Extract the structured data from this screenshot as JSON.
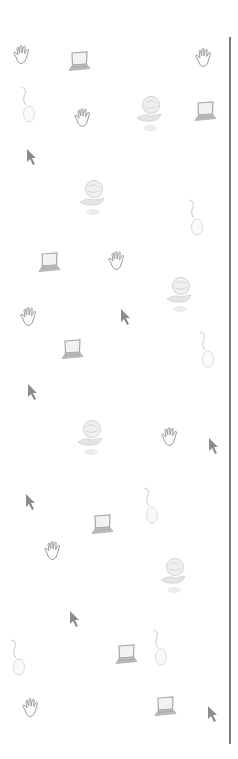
{
  "background": {
    "color": "#ffffff",
    "pattern": "computer-clipart-wallpaper"
  },
  "divider": {
    "color": "#7a7a7a",
    "x": 229,
    "top": 37,
    "bottom": 744
  },
  "colors": {
    "hand": "#9a9a9a",
    "laptop": "#a8a8a8",
    "laptop_screen": "#f2f2f2",
    "mouse": "#d8d8d8",
    "globe": "#d4d4d4",
    "cursor": "#8c8c8c"
  },
  "icons": [
    {
      "type": "hand-icon",
      "x": 11,
      "y": 44
    },
    {
      "type": "laptop-icon",
      "x": 66,
      "y": 50
    },
    {
      "type": "hand-icon",
      "x": 193,
      "y": 47
    },
    {
      "type": "mouse-icon",
      "x": 18,
      "y": 85
    },
    {
      "type": "hand-icon",
      "x": 72,
      "y": 107
    },
    {
      "type": "globe-icon",
      "x": 133,
      "y": 94
    },
    {
      "type": "laptop-icon",
      "x": 192,
      "y": 100
    },
    {
      "type": "cursor-icon",
      "x": 25,
      "y": 148
    },
    {
      "type": "globe-icon",
      "x": 76,
      "y": 178
    },
    {
      "type": "mouse-icon",
      "x": 186,
      "y": 198
    },
    {
      "type": "laptop-icon",
      "x": 36,
      "y": 251
    },
    {
      "type": "hand-icon",
      "x": 106,
      "y": 250
    },
    {
      "type": "globe-icon",
      "x": 163,
      "y": 275
    },
    {
      "type": "cursor-icon",
      "x": 119,
      "y": 308
    },
    {
      "type": "hand-icon",
      "x": 18,
      "y": 306
    },
    {
      "type": "laptop-icon",
      "x": 59,
      "y": 338
    },
    {
      "type": "mouse-icon",
      "x": 197,
      "y": 330
    },
    {
      "type": "cursor-icon",
      "x": 26,
      "y": 383
    },
    {
      "type": "globe-icon",
      "x": 74,
      "y": 418
    },
    {
      "type": "hand-icon",
      "x": 159,
      "y": 426
    },
    {
      "type": "cursor-icon",
      "x": 207,
      "y": 437
    },
    {
      "type": "mouse-icon",
      "x": 141,
      "y": 486
    },
    {
      "type": "cursor-icon",
      "x": 24,
      "y": 493
    },
    {
      "type": "laptop-icon",
      "x": 89,
      "y": 513
    },
    {
      "type": "hand-icon",
      "x": 42,
      "y": 540
    },
    {
      "type": "globe-icon",
      "x": 157,
      "y": 556
    },
    {
      "type": "cursor-icon",
      "x": 68,
      "y": 610
    },
    {
      "type": "mouse-icon",
      "x": 150,
      "y": 628
    },
    {
      "type": "mouse-icon",
      "x": 8,
      "y": 638
    },
    {
      "type": "laptop-icon",
      "x": 113,
      "y": 643
    },
    {
      "type": "hand-icon",
      "x": 20,
      "y": 697
    },
    {
      "type": "laptop-icon",
      "x": 152,
      "y": 695
    },
    {
      "type": "cursor-icon",
      "x": 206,
      "y": 705
    }
  ]
}
